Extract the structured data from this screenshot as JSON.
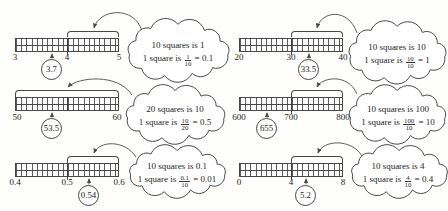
{
  "figure": {
    "panels": [
      {
        "id": "top-left",
        "ticks": [
          "3",
          "4",
          "5"
        ],
        "value": "3.7",
        "cloud": {
          "line1": "10 squares is 1",
          "line2_prefix": "1 square is",
          "frac_num": "1",
          "frac_den": "10",
          "line2_suffix": "= 0.1"
        }
      },
      {
        "id": "top-right",
        "ticks": [
          "20",
          "30",
          "40"
        ],
        "value": "33.5",
        "cloud": {
          "line1": "10 squares is 10",
          "line2_prefix": "1 square is",
          "frac_num": "10",
          "frac_den": "10",
          "line2_suffix": "= 1"
        }
      },
      {
        "id": "middle-left",
        "ticks": [
          "50",
          "60"
        ],
        "value": "53.5",
        "cloud": {
          "line1": "20 squares is 10",
          "line2_prefix": "1 square is",
          "frac_num": "10",
          "frac_den": "20",
          "line2_suffix": "= 0.5"
        }
      },
      {
        "id": "middle-right",
        "ticks": [
          "600",
          "700",
          "800"
        ],
        "value": "655",
        "cloud": {
          "line1": "10 squares is 100",
          "line2_prefix": "1 square is",
          "frac_num": "100",
          "frac_den": "10",
          "line2_suffix": "= 10"
        }
      },
      {
        "id": "bottom-left",
        "ticks": [
          "0.4",
          "0.5",
          "0.6"
        ],
        "value": "0.54",
        "cloud": {
          "line1": "10 squares is 0.1",
          "line2_prefix": "1 square is",
          "frac_num": "0.1",
          "frac_den": "10",
          "line2_suffix": "= 0.01"
        }
      },
      {
        "id": "bottom-right",
        "ticks": [
          "0",
          "4",
          "8"
        ],
        "value": "5.2",
        "cloud": {
          "line1": "10 squares is 4",
          "line2_prefix": "1 square is",
          "frac_num": "4",
          "frac_den": "10",
          "line2_suffix": "= 0.4"
        }
      }
    ]
  }
}
